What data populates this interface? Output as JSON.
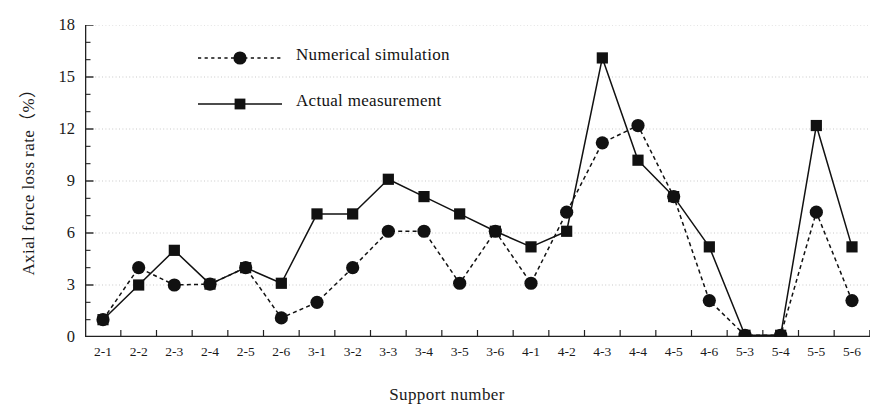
{
  "chart_data": {
    "type": "line",
    "title": "",
    "xlabel": "Support number",
    "ylabel": "Axial force loss rate（%）",
    "ylim": [
      0,
      18
    ],
    "yticks": [
      0,
      3,
      6,
      9,
      12,
      15,
      18
    ],
    "ytick_labels": [
      "0",
      "3",
      "6",
      "9",
      "12",
      "15",
      "18"
    ],
    "minor_ticks_per_interval": 2,
    "grid": "horizontal-dotted",
    "legend_position": "upper-left-inside",
    "categories": [
      "2-1",
      "2-2",
      "2-3",
      "2-4",
      "2-5",
      "2-6",
      "3-1",
      "3-2",
      "3-3",
      "3-4",
      "3-5",
      "3-6",
      "4-1",
      "4-2",
      "4-3",
      "4-4",
      "4-5",
      "4-6",
      "5-3",
      "5-4",
      "5-5",
      "5-6"
    ],
    "series": [
      {
        "name": "Numerical simulation",
        "marker": "circle",
        "linestyle": "dashed",
        "color": "#111111",
        "values": [
          1.0,
          4.0,
          3.0,
          3.05,
          4.0,
          1.1,
          2.0,
          4.0,
          6.1,
          6.1,
          3.1,
          6.1,
          3.1,
          7.2,
          11.2,
          12.2,
          8.1,
          2.1,
          0.1,
          0.1,
          7.2,
          2.1
        ]
      },
      {
        "name": "Actual measurement",
        "marker": "square",
        "linestyle": "solid",
        "color": "#111111",
        "values": [
          1.0,
          3.0,
          5.0,
          3.05,
          4.0,
          3.1,
          7.1,
          7.1,
          9.1,
          8.1,
          7.1,
          6.1,
          5.2,
          6.1,
          16.1,
          10.2,
          8.1,
          5.2,
          0.1,
          0.1,
          12.2,
          5.2
        ]
      }
    ]
  },
  "legend": {
    "items": [
      {
        "label": "Numerical simulation",
        "marker": "circle-marker",
        "style": "dotted"
      },
      {
        "label": "Actual measurement",
        "marker": "square-marker",
        "style": "solid"
      }
    ]
  },
  "colors": {
    "ink": "#111111",
    "axis": "#222222",
    "grid": "#c9c9c9",
    "background": "#ffffff"
  }
}
